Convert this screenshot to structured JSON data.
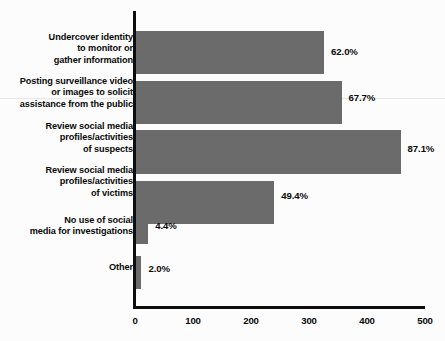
{
  "chart_data": {
    "type": "bar",
    "orientation": "horizontal",
    "title": "",
    "xlabel": "",
    "ylabel": "",
    "xlim": [
      0,
      500
    ],
    "xticks": [
      "0",
      "100",
      "200",
      "300",
      "400",
      "500"
    ],
    "grid": false,
    "legend": null,
    "bar_color": "#6b6b6b",
    "background_color": "#fcfcfc",
    "categories": [
      "Undercover identity\nto monitor or\ngather information",
      "Posting surveillance video\nor images to solicit\nassistance from the public",
      "Review social media\nprofiles/activities\nof suspects",
      "Review social media\nprofiles/activities\nof victims",
      "No use of social\nmedia for investigations",
      "Other"
    ],
    "values": [
      326,
      356,
      458,
      240,
      23,
      11
    ],
    "data_labels": [
      "62.0%",
      "67.7%",
      "87.1%",
      "49.4%",
      "4.4%",
      "2.0%"
    ],
    "percentages": [
      62.0,
      67.7,
      87.1,
      49.4,
      4.4,
      2.0
    ],
    "bars": [
      {
        "label": "Undercover identity\nto monitor or\ngather information",
        "value": 326,
        "data_label": "62.0%",
        "percent": 62.0
      },
      {
        "label": "Posting surveillance video\nor images to solicit\nassistance from the public",
        "value": 356,
        "data_label": "67.7%",
        "percent": 67.7
      },
      {
        "label": "Review social media\nprofiles/activities\nof suspects",
        "value": 458,
        "data_label": "87.1%",
        "percent": 87.1
      },
      {
        "label": "Review social media\nprofiles/activities\nof victims",
        "value": 240,
        "data_label": "49.4%",
        "percent": 49.4
      },
      {
        "label": "No use of social\nmedia for investigations",
        "value": 23,
        "data_label": "4.4%",
        "percent": 4.4
      },
      {
        "label": "Other",
        "value": 11,
        "data_label": "2.0%",
        "percent": 2.0
      }
    ]
  }
}
